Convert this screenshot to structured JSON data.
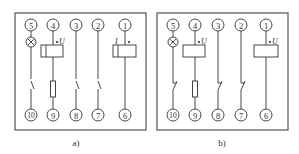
{
  "diagrams": [
    {
      "id": "a",
      "caption": "a)",
      "top_terminals": [
        "5",
        "4",
        "3",
        "2",
        "1"
      ],
      "bottom_terminals": [
        "10",
        "9",
        "8",
        "7",
        "6"
      ],
      "coil_labels": {
        "left": "U",
        "right": "I"
      },
      "contact_style": "normally-open"
    },
    {
      "id": "b",
      "caption": "b)",
      "top_terminals": [
        "5",
        "4",
        "3",
        "2",
        "1"
      ],
      "bottom_terminals": [
        "10",
        "9",
        "8",
        "7",
        "6"
      ],
      "coil_labels": {
        "left": "U",
        "right": "U"
      },
      "contact_style": "normally-closed"
    }
  ],
  "colors": {
    "line": "#333333",
    "background": "#ffffff"
  }
}
